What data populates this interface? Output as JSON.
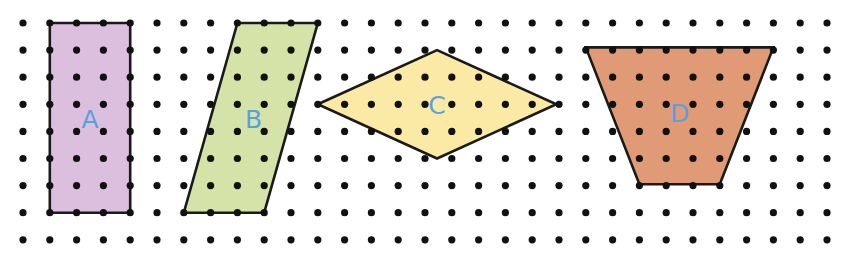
{
  "diagram": {
    "grid": {
      "columns": 31,
      "rows": 9,
      "dot_color": "#111111"
    },
    "label_color": "#5aa0e0",
    "outline_color": "#1a1a1a",
    "shapes": [
      {
        "id": "A",
        "label": "A",
        "kind": "rectangle",
        "fill": "#dcbede",
        "vertices_grid": [
          [
            1,
            0
          ],
          [
            4,
            0
          ],
          [
            4,
            7
          ],
          [
            1,
            7
          ]
        ],
        "label_grid": [
          2.5,
          3.6
        ]
      },
      {
        "id": "B",
        "label": "B",
        "kind": "parallelogram",
        "fill": "#d5e3a9",
        "vertices_grid": [
          [
            8,
            0
          ],
          [
            11,
            0
          ],
          [
            9,
            7
          ],
          [
            6,
            7
          ]
        ],
        "label_grid": [
          8.6,
          3.6
        ]
      },
      {
        "id": "C",
        "label": "C",
        "kind": "rhombus",
        "fill": "#fbe9a6",
        "vertices_grid": [
          [
            11,
            3
          ],
          [
            15.45,
            1
          ],
          [
            19.9,
            3
          ],
          [
            15.45,
            5
          ]
        ],
        "label_grid": [
          15.45,
          3.1
        ]
      },
      {
        "id": "D",
        "label": "D",
        "kind": "trapezoid",
        "fill": "#e09a75",
        "vertices_grid": [
          [
            21,
            0.9
          ],
          [
            28,
            0.9
          ],
          [
            26,
            5.95
          ],
          [
            23,
            5.95
          ]
        ],
        "label_grid": [
          24.5,
          3.4
        ]
      }
    ]
  }
}
